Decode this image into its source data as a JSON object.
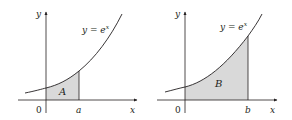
{
  "figure": {
    "panels": [
      {
        "id": "left",
        "curve_label": "y = e",
        "curve_label_exp": "x",
        "y_axis_label": "y",
        "x_axis_label": "x",
        "origin_label": "0",
        "bound_label": "a",
        "region_label": "A"
      },
      {
        "id": "right",
        "curve_label": "y = e",
        "curve_label_exp": "x",
        "y_axis_label": "y",
        "x_axis_label": "x",
        "origin_label": "0",
        "bound_label": "b",
        "region_label": "B"
      }
    ],
    "colors": {
      "shade": "#d9d9d9",
      "line": "#231f20",
      "background": "#ffffff"
    }
  }
}
